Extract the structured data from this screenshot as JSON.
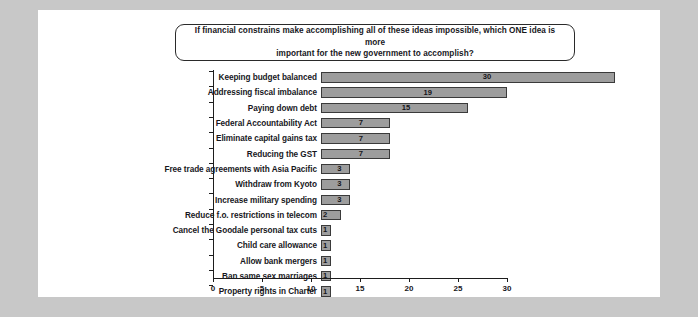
{
  "chart_data": {
    "type": "bar",
    "orientation": "horizontal",
    "title": "If financial constrains make accomplishing all of these ideas impossible, which ONE idea is more important for the new government to accomplish?",
    "title_line_1": "If financial constrains make accomplishing all of these ideas impossible, which ONE idea is more",
    "title_line_2": "important for the new government to accomplish?",
    "xlabel": "",
    "ylabel": "",
    "xlim": [
      0,
      30
    ],
    "xticks": [
      0,
      5,
      10,
      15,
      20,
      25,
      30
    ],
    "xtick_labels": [
      "0",
      "5",
      "10",
      "15",
      "20",
      "25",
      "30"
    ],
    "grid": false,
    "legend": "none",
    "show_data_labels": true,
    "bar_color": "#9d9d9d",
    "bar_border_color": "#3a3a3a",
    "categories": [
      "Keeping budget balanced",
      "Addressing fiscal imbalance",
      "Paying down debt",
      "Federal Accountability Act",
      "Eliminate capital gains tax",
      "Reducing the GST",
      "Free trade agreements with Asia Pacific",
      "Withdraw from Kyoto",
      "Increase military spending",
      "Reduce f.o. restrictions in telecom",
      "Cancel the Goodale personal tax cuts",
      "Child care allowance",
      "Allow bank mergers",
      "Ban same sex marriages",
      "Property rights in Charter"
    ],
    "values": [
      30,
      19,
      15,
      7,
      7,
      7,
      3,
      3,
      3,
      2,
      1,
      1,
      1,
      1,
      1
    ],
    "series": [
      {
        "name": "Responses",
        "values": [
          30,
          19,
          15,
          7,
          7,
          7,
          3,
          3,
          3,
          2,
          1,
          1,
          1,
          1,
          1
        ]
      }
    ],
    "points": [
      {
        "label": "Keeping budget balanced",
        "value": 30
      },
      {
        "label": "Addressing fiscal imbalance",
        "value": 19
      },
      {
        "label": "Paying down debt",
        "value": 15
      },
      {
        "label": "Federal Accountability Act",
        "value": 7
      },
      {
        "label": "Eliminate capital gains tax",
        "value": 7
      },
      {
        "label": "Reducing the GST",
        "value": 7
      },
      {
        "label": "Free trade agreements with Asia Pacific",
        "value": 3
      },
      {
        "label": "Withdraw from Kyoto",
        "value": 3
      },
      {
        "label": "Increase military spending",
        "value": 3
      },
      {
        "label": "Reduce f.o. restrictions in telecom",
        "value": 2
      },
      {
        "label": "Cancel the Goodale personal tax cuts",
        "value": 1
      },
      {
        "label": "Child care allowance",
        "value": 1
      },
      {
        "label": "Allow bank mergers",
        "value": 1
      },
      {
        "label": "Ban same sex marriages",
        "value": 1
      },
      {
        "label": "Property rights in Charter",
        "value": 1
      }
    ]
  },
  "page": {
    "background_color": "#c8c8c8",
    "panel_color": "#ffffff"
  }
}
